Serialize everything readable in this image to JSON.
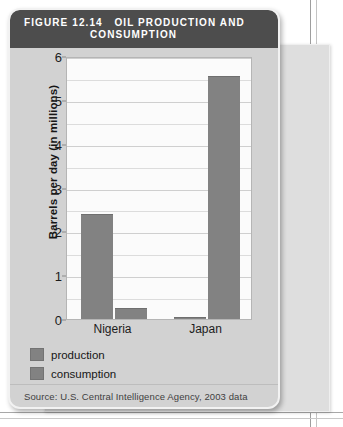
{
  "figure": {
    "number_label": "FIGURE 12.14",
    "title_line1": "OIL PRODUCTION AND",
    "title_line2": "CONSUMPTION",
    "source": "Source: U.S. Central Intelligence Agency, 2003 data",
    "header_bg": "#4d4d4d",
    "card_bg": "#d2d2d2",
    "bar_color": "#828282"
  },
  "legend": {
    "items": [
      {
        "label": "production",
        "color": "#828282"
      },
      {
        "label": "consumption",
        "color": "#828282"
      }
    ]
  },
  "chart_data": {
    "type": "bar",
    "title": "OIL PRODUCTION AND CONSUMPTION",
    "categories": [
      "Nigeria",
      "Japan"
    ],
    "series": [
      {
        "name": "production",
        "values": [
          2.4,
          0.05
        ],
        "color": "#828282"
      },
      {
        "name": "consumption",
        "values": [
          0.25,
          5.55
        ],
        "color": "#828282"
      }
    ],
    "xlabel": "",
    "ylabel": "Barrels per day (in millions)",
    "ylim": [
      0,
      6
    ],
    "yticks": [
      0,
      1,
      2,
      3,
      4,
      5,
      6
    ],
    "ytick_labels": [
      "0",
      "1",
      "2",
      "3",
      "4",
      "5",
      "6"
    ],
    "gridline_interval": 0.5,
    "grid": true,
    "legend_position": "below-plot-left",
    "source_note": "Source: U.S. Central Intelligence Agency, 2003 data"
  }
}
